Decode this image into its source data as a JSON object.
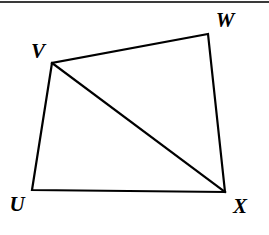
{
  "figure": {
    "kind": "quadrilateral-with-diagonal",
    "name": "Quadrilateral UVWX",
    "stroke_color": "#000000",
    "fill_color": "#ffffff",
    "background_color": "#ffffff",
    "stroke_width": 2.2,
    "top_rule_color": "#3a3a3a",
    "vertices": [
      {
        "id": "U",
        "label": "U",
        "x": 32,
        "y": 190,
        "label_x": 17,
        "label_y": 204
      },
      {
        "id": "V",
        "label": "V",
        "x": 52,
        "y": 63,
        "label_x": 38,
        "label_y": 51
      },
      {
        "id": "W",
        "label": "W",
        "x": 208,
        "y": 34,
        "label_x": 225,
        "label_y": 20
      },
      {
        "id": "X",
        "label": "X",
        "x": 225,
        "y": 192,
        "label_x": 240,
        "label_y": 206
      }
    ],
    "outline_path": "M 32 190 L 52 63 L 208 34 L 225 192 Z",
    "segments": [
      {
        "id": "UV",
        "from": "U",
        "to": "V",
        "type": "side"
      },
      {
        "id": "VW",
        "from": "V",
        "to": "W",
        "type": "side"
      },
      {
        "id": "WX",
        "from": "W",
        "to": "X",
        "type": "side"
      },
      {
        "id": "XU",
        "from": "X",
        "to": "U",
        "type": "side"
      },
      {
        "id": "VX",
        "from": "V",
        "to": "X",
        "type": "diagonal",
        "path": "M 52 63 L 225 192"
      }
    ]
  }
}
